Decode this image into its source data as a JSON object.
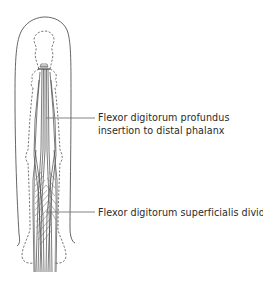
{
  "figure": {
    "colors": {
      "outline": "#555555",
      "tendon": "#444444",
      "leader": "#777777",
      "text": "#2a2a2a"
    }
  },
  "labels": [
    {
      "id": "fdp",
      "lines": [
        "Flexor digitorum profundus",
        "insertion to distal phalanx"
      ]
    },
    {
      "id": "fds",
      "lines": [
        "Flexor digitorum superficialis dividing"
      ]
    }
  ]
}
